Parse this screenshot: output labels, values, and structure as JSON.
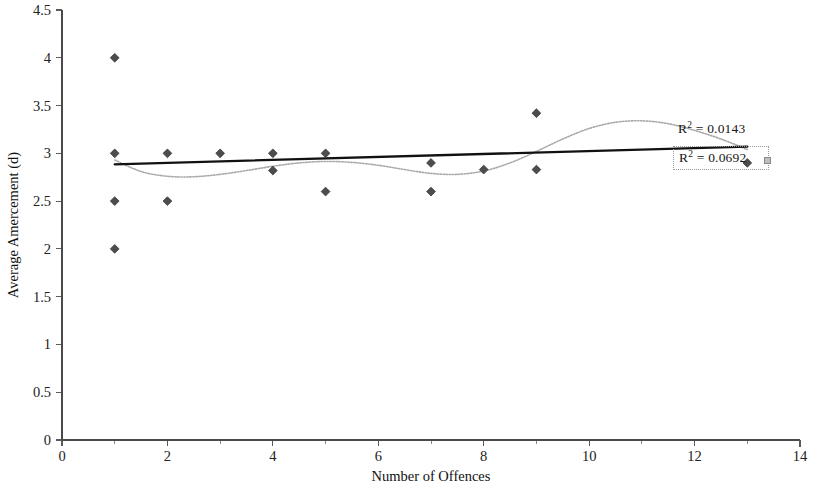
{
  "chart_data": {
    "type": "scatter",
    "title": "",
    "xlabel": "Number of Offences",
    "ylabel": "Average Amercement (d)",
    "xlim": [
      0,
      14
    ],
    "ylim": [
      0,
      4.5
    ],
    "xticks": [
      0,
      2,
      4,
      6,
      8,
      10,
      12,
      14
    ],
    "xtick_labels": [
      "0",
      "2",
      "4",
      "6",
      "8",
      "10",
      "12",
      "14"
    ],
    "xminor_ticks": [
      1,
      3,
      5,
      7,
      9,
      11,
      13
    ],
    "yticks": [
      0,
      0.5,
      1,
      1.5,
      2,
      2.5,
      3,
      3.5,
      4,
      4.5
    ],
    "ytick_labels": [
      "0",
      "0.5",
      "1",
      "1.5",
      "2",
      "2.5",
      "3",
      "3.5",
      "4",
      "4.5"
    ],
    "grid": false,
    "legend": "none",
    "marker": "diamond",
    "marker_color": "#4d4d4d",
    "points": [
      {
        "x": 1,
        "y": 4.0
      },
      {
        "x": 1,
        "y": 3.0
      },
      {
        "x": 1,
        "y": 2.5
      },
      {
        "x": 1,
        "y": 2.0
      },
      {
        "x": 2,
        "y": 3.0
      },
      {
        "x": 2,
        "y": 2.5
      },
      {
        "x": 3,
        "y": 3.0
      },
      {
        "x": 4,
        "y": 3.0
      },
      {
        "x": 4,
        "y": 2.82
      },
      {
        "x": 5,
        "y": 3.0
      },
      {
        "x": 5,
        "y": 2.6
      },
      {
        "x": 7,
        "y": 2.9
      },
      {
        "x": 7,
        "y": 2.6
      },
      {
        "x": 8,
        "y": 2.83
      },
      {
        "x": 9,
        "y": 3.42
      },
      {
        "x": 9,
        "y": 2.83
      },
      {
        "x": 13,
        "y": 2.9
      }
    ],
    "series": [
      {
        "name": "linear-trendline",
        "kind": "line",
        "style": "solid",
        "color": "#111111",
        "r_squared": 0.0692,
        "r_squared_label": "R² = 0.0692",
        "x": [
          1,
          13
        ],
        "y": [
          2.885,
          3.07
        ]
      },
      {
        "name": "polynomial-trendline",
        "kind": "line",
        "style": "dotted",
        "color": "#a9a9a9",
        "r_squared": 0.0143,
        "r_squared_label": "R² = 0.0143",
        "x": [
          1,
          1.5,
          2,
          2.5,
          3,
          3.5,
          4,
          4.5,
          5,
          5.5,
          6,
          6.5,
          7,
          7.5,
          8,
          8.5,
          9,
          9.5,
          10,
          10.5,
          11,
          11.5,
          12,
          12.5,
          13
        ],
        "y": [
          2.93,
          2.81,
          2.76,
          2.755,
          2.78,
          2.82,
          2.865,
          2.9,
          2.915,
          2.905,
          2.875,
          2.83,
          2.79,
          2.78,
          2.815,
          2.9,
          3.02,
          3.15,
          3.26,
          3.325,
          3.34,
          3.31,
          3.24,
          3.15,
          3.04
        ]
      }
    ],
    "annotations": [
      {
        "name": "r2-poly",
        "text_prefix": "R",
        "text_sup": "2",
        "text_suffix": " = 0.0143",
        "boxed": false
      },
      {
        "name": "r2-linear",
        "text_prefix": "R",
        "text_sup": "2",
        "text_suffix": " = 0.0692",
        "boxed": true,
        "selected": true
      }
    ]
  },
  "axes": {
    "x_title": "Number of Offences",
    "y_title": "Average Amercement (d)"
  }
}
